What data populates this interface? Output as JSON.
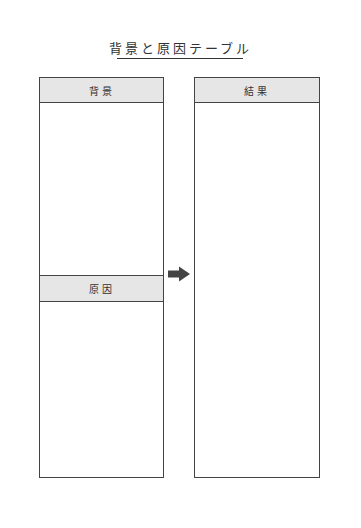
{
  "title": "背景と原因テーブル",
  "left_column": {
    "top_header": "背景",
    "middle_header": "原因"
  },
  "right_column": {
    "header": "結果"
  },
  "arrow": {
    "icon": "right-arrow-icon",
    "color": "#444444"
  },
  "colors": {
    "header_bg": "#e6e6e6",
    "border": "#444444"
  }
}
